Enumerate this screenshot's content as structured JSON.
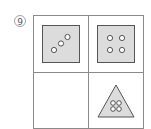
{
  "problem": {
    "number": "9",
    "number_label": "⑨"
  },
  "grid": {
    "rows": 2,
    "cols": 2,
    "cells": [
      {
        "shape": "square",
        "dots": 3,
        "arrangement": "diagonal"
      },
      {
        "shape": "square",
        "dots": 4,
        "arrangement": "2x2"
      },
      {
        "shape": "empty",
        "dots": 0
      },
      {
        "shape": "triangle",
        "dots": 4,
        "arrangement": "2x2"
      }
    ]
  },
  "colors": {
    "border": "#8a8a8a",
    "shape_fill": "#dcdcdc",
    "shape_stroke": "#555555",
    "dot_fill": "#ffffff",
    "dot_stroke": "#444444"
  }
}
